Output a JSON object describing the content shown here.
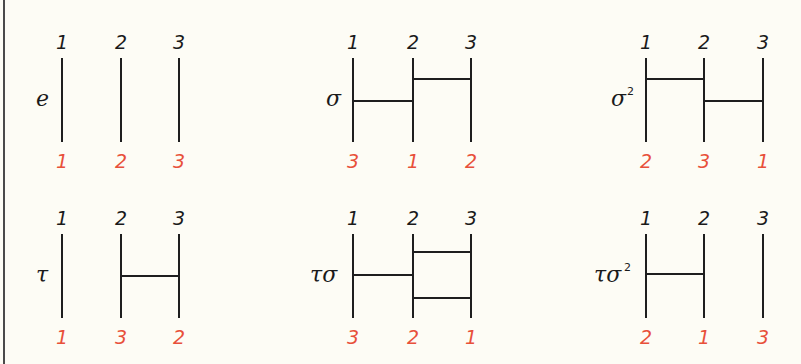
{
  "colors": {
    "background": "#fdfcf5",
    "line": "#1e1e1e",
    "top_label": "#1a1a1a",
    "bottom_label": "#e8503a",
    "border": "#4a4a4a"
  },
  "panels": [
    {
      "name": "e",
      "superscript": "",
      "top_labels": [
        "1",
        "2",
        "3"
      ],
      "bottom_labels": [
        "1",
        "2",
        "3"
      ],
      "strand_x": [
        62,
        121,
        179
      ],
      "y_top": 58,
      "y_bottom": 142,
      "label_x": 36,
      "label_y": 106,
      "rungs": []
    },
    {
      "name": "σ",
      "superscript": "",
      "top_labels": [
        "1",
        "2",
        "3"
      ],
      "bottom_labels": [
        "3",
        "1",
        "2"
      ],
      "strand_x": [
        353,
        413,
        471
      ],
      "y_top": 58,
      "y_bottom": 142,
      "label_x": 326,
      "label_y": 106,
      "rungs": [
        {
          "from": 0,
          "to": 1,
          "y": 101
        },
        {
          "from": 1,
          "to": 2,
          "y": 79
        }
      ]
    },
    {
      "name": "σ",
      "superscript": "2",
      "top_labels": [
        "1",
        "2",
        "3"
      ],
      "bottom_labels": [
        "2",
        "3",
        "1"
      ],
      "strand_x": [
        646,
        704,
        763
      ],
      "y_top": 58,
      "y_bottom": 142,
      "label_x": 611,
      "label_y": 106,
      "rungs": [
        {
          "from": 0,
          "to": 1,
          "y": 79
        },
        {
          "from": 1,
          "to": 2,
          "y": 101
        }
      ]
    },
    {
      "name": "τ",
      "superscript": "",
      "top_labels": [
        "1",
        "2",
        "3"
      ],
      "bottom_labels": [
        "1",
        "3",
        "2"
      ],
      "strand_x": [
        62,
        121,
        179
      ],
      "y_top": 234,
      "y_bottom": 318,
      "label_x": 36,
      "label_y": 282,
      "rungs": [
        {
          "from": 1,
          "to": 2,
          "y": 276
        }
      ]
    },
    {
      "name": "τσ",
      "superscript": "",
      "top_labels": [
        "1",
        "2",
        "3"
      ],
      "bottom_labels": [
        "3",
        "2",
        "1"
      ],
      "strand_x": [
        353,
        413,
        471
      ],
      "y_top": 234,
      "y_bottom": 318,
      "label_x": 310,
      "label_y": 282,
      "rungs": [
        {
          "from": 1,
          "to": 2,
          "y": 252
        },
        {
          "from": 0,
          "to": 1,
          "y": 275
        },
        {
          "from": 1,
          "to": 2,
          "y": 298
        }
      ]
    },
    {
      "name": "τσ",
      "superscript": "2",
      "top_labels": [
        "1",
        "2",
        "3"
      ],
      "bottom_labels": [
        "2",
        "1",
        "3"
      ],
      "strand_x": [
        646,
        704,
        763
      ],
      "y_top": 234,
      "y_bottom": 318,
      "label_x": 594,
      "label_y": 282,
      "rungs": [
        {
          "from": 0,
          "to": 1,
          "y": 274
        }
      ]
    }
  ]
}
